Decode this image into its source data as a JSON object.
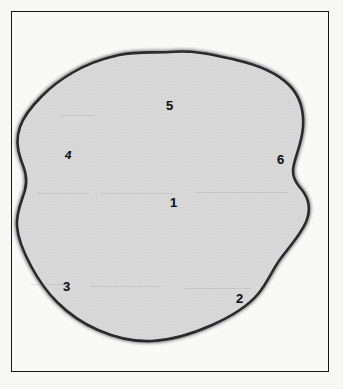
{
  "figure": {
    "kind": "labeled-region-diagram",
    "frame": {
      "visible": true,
      "border_color": "#15161a",
      "background_color": "#f9f9f7"
    },
    "blob": {
      "name": "amoeba-shaped-region",
      "fill_color": "#d9d9d9",
      "outline_color": "#2b2b2d",
      "halo_color": "#8d8d8f",
      "outline_width_px": 2.6
    },
    "page_background": "#fbfbf9"
  },
  "labels": [
    {
      "id": "label-1",
      "text": "1",
      "x": 170,
      "y": 196,
      "style": "thin",
      "position": "center"
    },
    {
      "id": "label-2",
      "text": "2",
      "x": 236,
      "y": 292,
      "style": "thin",
      "position": "bottom-right"
    },
    {
      "id": "label-3",
      "text": "3",
      "x": 63,
      "y": 280,
      "style": "thin",
      "position": "bottom-left"
    },
    {
      "id": "label-4",
      "text": "4",
      "x": 65,
      "y": 150,
      "style": "slanted",
      "position": "left"
    },
    {
      "id": "label-5",
      "text": "5",
      "x": 166,
      "y": 99,
      "style": "thin",
      "position": "top"
    },
    {
      "id": "label-6",
      "text": "6",
      "x": 277,
      "y": 153,
      "style": "thin",
      "position": "right"
    }
  ],
  "streaks": [
    {
      "x": 37,
      "y": 193,
      "width": 52
    },
    {
      "x": 100,
      "y": 193,
      "width": 74
    },
    {
      "x": 196,
      "y": 192,
      "width": 92
    },
    {
      "x": 30,
      "y": 284,
      "width": 40
    },
    {
      "x": 90,
      "y": 286,
      "width": 70
    },
    {
      "x": 185,
      "y": 288,
      "width": 66
    },
    {
      "x": 60,
      "y": 115,
      "width": 34
    }
  ]
}
